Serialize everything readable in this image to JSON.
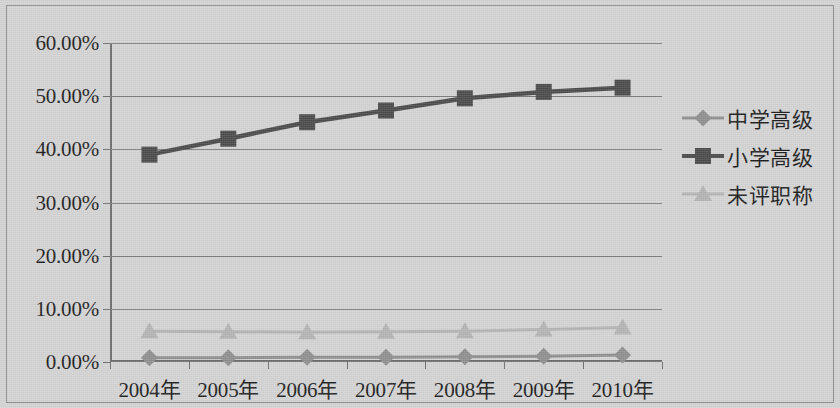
{
  "chart_data": {
    "type": "line",
    "title": "",
    "subtitle": "",
    "xlabel": "",
    "ylabel": "",
    "categories": [
      "2004年",
      "2005年",
      "2006年",
      "2007年",
      "2008年",
      "2009年",
      "2010年"
    ],
    "ylim": [
      0,
      60
    ],
    "ytick_values": [
      0,
      10,
      20,
      30,
      40,
      50,
      60
    ],
    "ytick_labels": [
      "0.00%",
      "10.00%",
      "20.00%",
      "30.00%",
      "40.00%",
      "50.00%",
      "60.00%"
    ],
    "grid": true,
    "legend_position": "right",
    "series": [
      {
        "name": "中学高级",
        "marker": "diamond",
        "color": "#8f8f8f",
        "values": [
          0.8,
          0.8,
          0.9,
          0.9,
          1.0,
          1.1,
          1.3
        ]
      },
      {
        "name": "小学高级",
        "marker": "square",
        "color": "#4a4a4a",
        "values": [
          39.0,
          42.0,
          45.1,
          47.3,
          49.6,
          50.8,
          51.6
        ]
      },
      {
        "name": "未评职称",
        "marker": "triangle",
        "color": "#b4b4b4",
        "values": [
          5.8,
          5.7,
          5.6,
          5.7,
          5.8,
          6.1,
          6.5
        ]
      }
    ]
  },
  "legend": {
    "items": [
      {
        "label": "中学高级",
        "marker": "diamond",
        "color": "#8f8f8f"
      },
      {
        "label": "小学高级",
        "marker": "square",
        "color": "#4a4a4a"
      },
      {
        "label": "未评职称",
        "marker": "triangle",
        "color": "#b4b4b4"
      }
    ]
  },
  "style": {
    "background": "#d4d4d4",
    "gridline_color": "#7c7c7c",
    "axis_color": "#6d6d6d",
    "text_color": "#1b1b1b",
    "frame_color": "#8d8d8d"
  }
}
